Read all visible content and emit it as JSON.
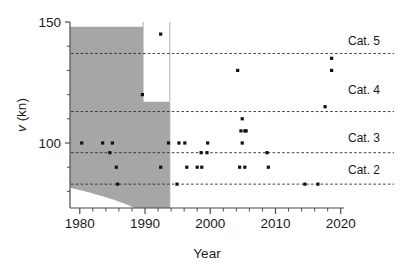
{
  "chart_data": {
    "type": "scatter",
    "title": "",
    "xlabel": "Year",
    "ylabel": "v (kn)",
    "ylabel_italic_part": "v",
    "ylabel_rest": " (kn)",
    "xlim": [
      1978.5,
      2020.5
    ],
    "ylim": [
      67,
      150
    ],
    "xticks": [
      1980,
      1990,
      2000,
      2010,
      2020
    ],
    "xticklabels": [
      "1980",
      "1990",
      "2000",
      "2010",
      "2020"
    ],
    "xminortick_step": 2,
    "yticks": [
      100,
      150
    ],
    "yticklabels": [
      "100",
      "150"
    ],
    "yminortick_step": 10,
    "grid": false,
    "legend_position": "none",
    "point_color": "#111111",
    "violin_color": "#a6a6a6",
    "axis_color": "#4d4d4d",
    "category_lines": [
      {
        "label": "Cat. 5",
        "value": 137,
        "label_y": 142
      },
      {
        "label": "Cat. 4",
        "value": 113,
        "label_y": 122
      },
      {
        "label": "Cat. 3",
        "value": 96,
        "label_y": 102
      },
      {
        "label": "Cat. 2",
        "value": 83,
        "label_y": 89
      }
    ],
    "points": [
      {
        "x": 1980.3,
        "y": 100
      },
      {
        "x": 1983.5,
        "y": 100
      },
      {
        "x": 1985.0,
        "y": 100
      },
      {
        "x": 1984.6,
        "y": 96
      },
      {
        "x": 1985.6,
        "y": 90
      },
      {
        "x": 1985.8,
        "y": 83
      },
      {
        "x": 1989.6,
        "y": 120
      },
      {
        "x": 1992.4,
        "y": 145
      },
      {
        "x": 1993.6,
        "y": 100
      },
      {
        "x": 1992.4,
        "y": 90
      },
      {
        "x": 1995.2,
        "y": 100
      },
      {
        "x": 1996.1,
        "y": 100
      },
      {
        "x": 1994.9,
        "y": 83
      },
      {
        "x": 1996.4,
        "y": 90
      },
      {
        "x": 1998.0,
        "y": 90
      },
      {
        "x": 1998.7,
        "y": 90
      },
      {
        "x": 1998.6,
        "y": 96
      },
      {
        "x": 1999.5,
        "y": 96
      },
      {
        "x": 1999.6,
        "y": 100
      },
      {
        "x": 2004.2,
        "y": 130
      },
      {
        "x": 2004.9,
        "y": 110
      },
      {
        "x": 2004.7,
        "y": 105
      },
      {
        "x": 2005.3,
        "y": 105
      },
      {
        "x": 2005.5,
        "y": 105
      },
      {
        "x": 2004.9,
        "y": 100
      },
      {
        "x": 2004.5,
        "y": 90
      },
      {
        "x": 2005.3,
        "y": 90
      },
      {
        "x": 2008.7,
        "y": 96
      },
      {
        "x": 2008.9,
        "y": 90
      },
      {
        "x": 2014.5,
        "y": 83
      },
      {
        "x": 2016.5,
        "y": 83
      },
      {
        "x": 2017.6,
        "y": 115
      },
      {
        "x": 2018.6,
        "y": 135
      },
      {
        "x": 2018.6,
        "y": 130
      }
    ],
    "violins": [
      {
        "name": "violin-1989",
        "center_x": 1989.7,
        "y_min": 90,
        "y_max": 148,
        "peak_y": 122,
        "max_width_kn": 14
      },
      {
        "name": "violin-1993",
        "center_x": 1993.8,
        "y_min": 72,
        "y_max": 117,
        "peak_y": 100,
        "max_width_kn": 13
      }
    ]
  },
  "axes": {
    "x_axis_title": "Year",
    "y_axis_title": "v (kn)"
  }
}
